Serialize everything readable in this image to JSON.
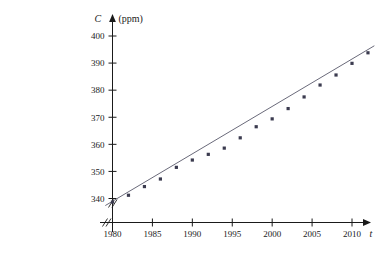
{
  "chart_data": {
    "type": "scatter",
    "title": "",
    "xlabel": "t",
    "ylabel": "C",
    "yunit": "(ppm)",
    "xlim": [
      1978.2,
      2013.5
    ],
    "ylim": [
      334.5,
      403.0
    ],
    "xticks": [
      1980,
      1985,
      1990,
      1995,
      2000,
      2005,
      2010
    ],
    "yticks": [
      340,
      350,
      360,
      370,
      380,
      390,
      400
    ],
    "xtick_labels": [
      "1980",
      "1985",
      "1990",
      "1995",
      "2000",
      "2005",
      "2010"
    ],
    "ytick_labels": [
      "340",
      "350",
      "360",
      "370",
      "380",
      "390",
      "400"
    ],
    "grid": false,
    "legend": null,
    "axis_break_x": true,
    "axis_break_y": true,
    "x": [
      1980,
      1982,
      1984,
      1986,
      1988,
      1990,
      1992,
      1994,
      1996,
      1998,
      2000,
      2002,
      2004,
      2006,
      2008,
      2010,
      2012
    ],
    "values": [
      338.7,
      341.2,
      344.4,
      347.2,
      351.5,
      354.2,
      356.3,
      358.6,
      362.4,
      366.5,
      369.4,
      373.2,
      377.5,
      381.9,
      385.6,
      389.9,
      393.8
    ],
    "series": [
      {
        "name": "CO2 concentration",
        "marker": "square",
        "values": [
          338.7,
          341.2,
          344.4,
          347.2,
          351.5,
          354.2,
          356.3,
          358.6,
          362.4,
          366.5,
          369.4,
          373.2,
          377.5,
          381.9,
          385.6,
          389.9,
          393.8
        ]
      }
    ],
    "trendline": {
      "type": "line",
      "x_start": 1979.1,
      "y_start": 337.4,
      "x_end": 2012.8,
      "y_end": 396.4
    },
    "colors": {
      "axis": "#1a1a1a",
      "marker": "#3b3b4f",
      "line": "#6a6a7a"
    }
  }
}
